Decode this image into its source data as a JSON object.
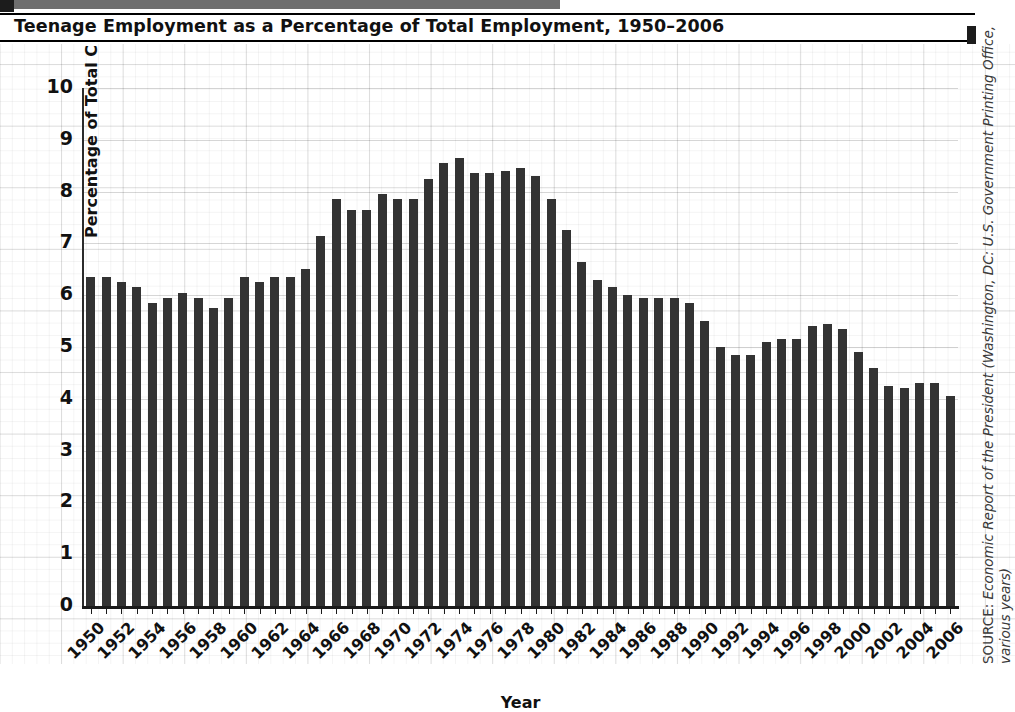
{
  "header": {
    "title": "Teenage Employment as a Percentage of Total Employment, 1950–2006"
  },
  "axis": {
    "y_title": "Percentage of Total Civilian Employment",
    "x_title": "Year",
    "y_ticks": [
      "10",
      "9",
      "8",
      "7",
      "6",
      "5",
      "4",
      "3",
      "2",
      "1",
      "0"
    ]
  },
  "source": {
    "label": "SOURCE:",
    "text": " Economic Report of the President (Washington, DC: U.S. Government Printing Office, various years)"
  },
  "chart_data": {
    "type": "bar",
    "title": "Teenage Employment as a Percentage of Total Employment, 1950–2006",
    "xlabel": "Year",
    "ylabel": "Percentage of Total Civilian Employment",
    "ylim": [
      0,
      10
    ],
    "ytick_step": 1,
    "grid": true,
    "legend": false,
    "bar_color": "#333333",
    "xtick_labels_every": 2,
    "categories": [
      1950,
      1951,
      1952,
      1953,
      1954,
      1955,
      1956,
      1957,
      1958,
      1959,
      1960,
      1961,
      1962,
      1963,
      1964,
      1965,
      1966,
      1967,
      1968,
      1969,
      1970,
      1971,
      1972,
      1973,
      1974,
      1975,
      1976,
      1977,
      1978,
      1979,
      1980,
      1981,
      1982,
      1983,
      1984,
      1985,
      1986,
      1987,
      1988,
      1989,
      1990,
      1991,
      1992,
      1993,
      1994,
      1995,
      1996,
      1997,
      1998,
      1999,
      2000,
      2001,
      2002,
      2003,
      2004,
      2005,
      2006
    ],
    "values": [
      6.35,
      6.35,
      6.25,
      6.15,
      5.85,
      5.95,
      6.05,
      5.95,
      5.75,
      5.95,
      6.35,
      6.25,
      6.35,
      6.35,
      6.5,
      7.15,
      7.85,
      7.65,
      7.65,
      7.95,
      7.85,
      7.85,
      8.25,
      8.55,
      8.65,
      8.35,
      8.35,
      8.4,
      8.45,
      8.3,
      7.85,
      7.25,
      6.65,
      6.3,
      6.15,
      6.0,
      5.95,
      5.95,
      5.95,
      5.85,
      5.5,
      5.0,
      4.85,
      4.85,
      5.1,
      5.15,
      5.15,
      5.4,
      5.45,
      5.35,
      4.9,
      4.6,
      4.25,
      4.2,
      4.3,
      4.3,
      4.05
    ]
  }
}
